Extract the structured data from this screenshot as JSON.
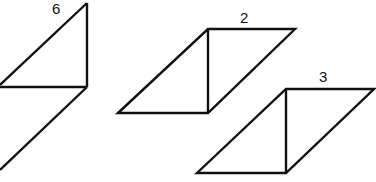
{
  "diagram": {
    "stroke_color": "#111111",
    "shapes": [
      {
        "label": "6",
        "label_pos": [
          52,
          1
        ],
        "lines": [
          [
            87,
            3,
            87,
            87
          ],
          [
            87,
            3,
            0,
            85
          ],
          [
            0,
            87,
            87,
            87
          ],
          [
            87,
            87,
            0,
            170
          ]
        ]
      },
      {
        "label": "2",
        "label_pos": [
          240,
          10
        ],
        "polygon": [
          [
            118,
            113
          ],
          [
            208,
            29
          ],
          [
            295,
            29
          ],
          [
            208,
            113
          ]
        ],
        "lines": [
          [
            208,
            29,
            208,
            113
          ]
        ]
      },
      {
        "label": "3",
        "label_pos": [
          319,
          69
        ],
        "polygon": [
          [
            197,
            173
          ],
          [
            286,
            89
          ],
          [
            374,
            89
          ],
          [
            286,
            173
          ]
        ],
        "lines": [
          [
            286,
            89,
            286,
            173
          ]
        ]
      }
    ]
  }
}
